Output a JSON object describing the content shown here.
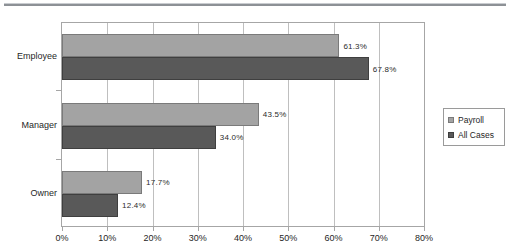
{
  "page": {
    "divider_name": "horizontal-rule"
  },
  "chart_data": {
    "type": "bar",
    "orientation": "horizontal",
    "title": "",
    "subtitle": "",
    "xlabel": "",
    "ylabel": "",
    "categories": [
      "Employee",
      "Manager",
      "Owner"
    ],
    "series": [
      {
        "name": "Payroll",
        "color": "#a3a3a3",
        "values": [
          61.3,
          43.5,
          17.7
        ],
        "labels": [
          "61.3%",
          "43.5%",
          "17.7%"
        ]
      },
      {
        "name": "All Cases",
        "color": "#595959",
        "values": [
          67.8,
          34.0,
          12.4
        ],
        "labels": [
          "67.8%",
          "34.0%",
          "12.4%"
        ]
      }
    ],
    "xlim": [
      0,
      80
    ],
    "xticks": [
      0,
      10,
      20,
      30,
      40,
      50,
      60,
      70,
      80
    ],
    "xtick_labels": [
      "0%",
      "10%",
      "20%",
      "30%",
      "40%",
      "50%",
      "60%",
      "70%",
      "80%"
    ],
    "grid": "vertical",
    "legend_position": "right",
    "legend_entries": [
      "Payroll",
      "All Cases"
    ],
    "data_labels_shown": true
  }
}
